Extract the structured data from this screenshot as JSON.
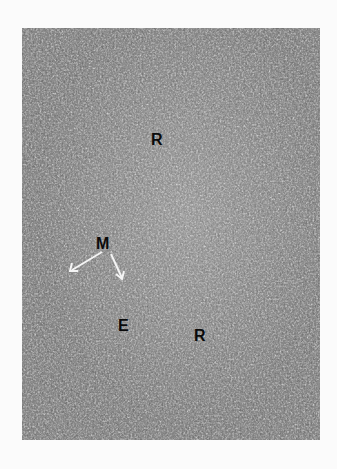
{
  "figure": {
    "labels": [
      {
        "id": "r1",
        "text": "R",
        "x": 151,
        "y": 132
      },
      {
        "id": "m",
        "text": "M",
        "x": 96,
        "y": 236
      },
      {
        "id": "e",
        "text": "E",
        "x": 118,
        "y": 318
      },
      {
        "id": "r2",
        "text": "R",
        "x": 194,
        "y": 328
      }
    ],
    "colors": {
      "page_background": "#fbfbfb",
      "tissue_mid": "#6f6f6f",
      "label": "#0a0a0a"
    }
  }
}
